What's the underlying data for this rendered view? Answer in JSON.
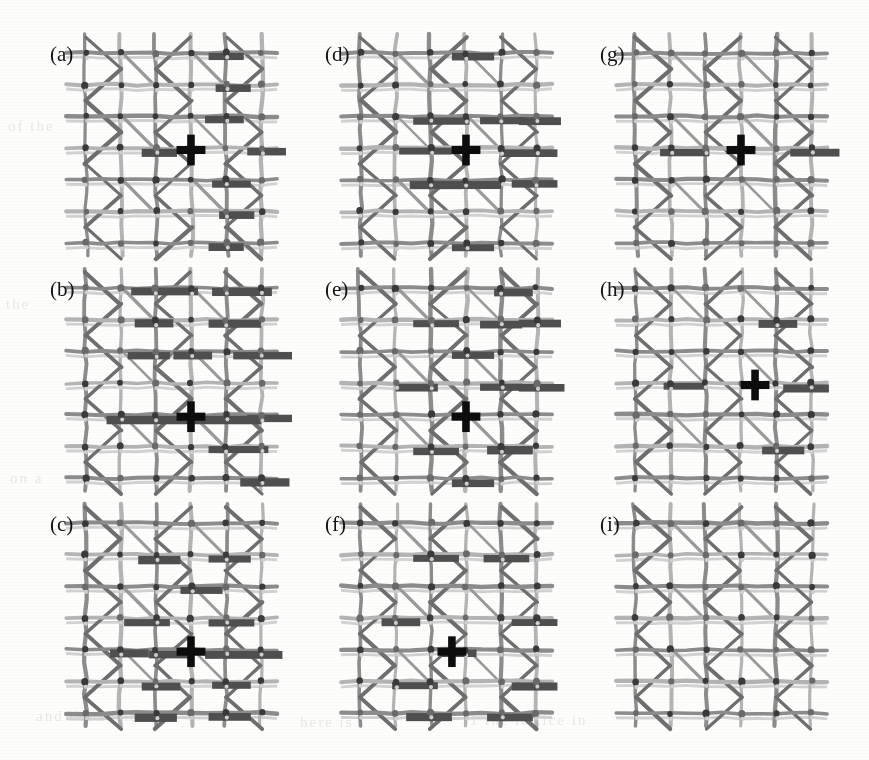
{
  "figure": {
    "title_visible": false,
    "kind": "multi-panel lattice network figure",
    "background_color": "#fdfdfc",
    "panel_rows": 3,
    "panel_cols": 3,
    "label_color": "#121212",
    "colors": {
      "grid_light": "#b4b4b4",
      "grid_mid": "#8c8c8c",
      "diagonal": "#6e6e6e",
      "bar_dark": "#4f4f4f",
      "node": "#3a3a3a",
      "marker": "#0d0d0d",
      "background": "#fdfdfc"
    },
    "legend_visible": false,
    "axes_visible": false
  },
  "chart_data": {
    "type": "diagram-grid",
    "title": "",
    "xlabel": "",
    "ylabel": "",
    "lattice": {
      "cols": 6,
      "rows": 7,
      "col_spacing": 39,
      "row_spacing": 33,
      "node_radius": 3.1
    },
    "panels": [
      {
        "id": "a",
        "label": "(a)",
        "row": 0,
        "col": 0,
        "marker": {
          "visible": true,
          "gx": 3,
          "gy": 3
        },
        "bars": [
          {
            "gx": 3.5,
            "gy": 0,
            "len": 1.0
          },
          {
            "gx": 3.7,
            "gy": 1,
            "len": 1.0
          },
          {
            "gx": 3.4,
            "gy": 2,
            "len": 1.1
          },
          {
            "gx": 1.6,
            "gy": 3,
            "len": 1.0
          },
          {
            "gx": 4.6,
            "gy": 3,
            "len": 1.1
          },
          {
            "gx": 3.6,
            "gy": 4,
            "len": 1.1
          },
          {
            "gx": 3.8,
            "gy": 5,
            "len": 1.0
          },
          {
            "gx": 3.5,
            "gy": 6,
            "len": 1.0
          }
        ]
      },
      {
        "id": "b",
        "label": "(b)",
        "row": 1,
        "col": 0,
        "marker": {
          "visible": true,
          "gx": 3,
          "gy": 4
        },
        "bars": [
          {
            "gx": 1.3,
            "gy": 0,
            "len": 1.9
          },
          {
            "gx": 3.6,
            "gy": 0,
            "len": 1.7
          },
          {
            "gx": 1.4,
            "gy": 1,
            "len": 1.1
          },
          {
            "gx": 3.5,
            "gy": 1,
            "len": 1.5
          },
          {
            "gx": 1.2,
            "gy": 2,
            "len": 1.2
          },
          {
            "gx": 2.5,
            "gy": 2,
            "len": 1.1
          },
          {
            "gx": 4.2,
            "gy": 2,
            "len": 1.8
          },
          {
            "gx": 0.6,
            "gy": 4,
            "len": 4.4
          },
          {
            "gx": 4.6,
            "gy": 4,
            "len": 1.6
          },
          {
            "gx": 3.5,
            "gy": 5,
            "len": 1.7
          },
          {
            "gx": 4.4,
            "gy": 6,
            "len": 1.4
          }
        ]
      },
      {
        "id": "c",
        "label": "(c)",
        "row": 2,
        "col": 0,
        "marker": {
          "visible": true,
          "gx": 3,
          "gy": 4
        },
        "bars": [
          {
            "gx": 1.5,
            "gy": 1,
            "len": 1.2
          },
          {
            "gx": 3.5,
            "gy": 1,
            "len": 1.2
          },
          {
            "gx": 2.7,
            "gy": 2,
            "len": 1.2
          },
          {
            "gx": 1.1,
            "gy": 3,
            "len": 1.3
          },
          {
            "gx": 3.5,
            "gy": 3,
            "len": 1.3
          },
          {
            "gx": 0.7,
            "gy": 4,
            "len": 1.1
          },
          {
            "gx": 1.8,
            "gy": 4,
            "len": 1.2
          },
          {
            "gx": 3.4,
            "gy": 4,
            "len": 2.2
          },
          {
            "gx": 1.6,
            "gy": 5,
            "len": 1.1
          },
          {
            "gx": 3.6,
            "gy": 5,
            "len": 1.1
          },
          {
            "gx": 1.4,
            "gy": 6,
            "len": 1.2
          },
          {
            "gx": 3.5,
            "gy": 6,
            "len": 1.2
          }
        ]
      },
      {
        "id": "d",
        "label": "(d)",
        "row": 0,
        "col": 1,
        "marker": {
          "visible": true,
          "gx": 3,
          "gy": 3
        },
        "bars": [
          {
            "gx": 2.6,
            "gy": 0,
            "len": 1.2
          },
          {
            "gx": 1.5,
            "gy": 2,
            "len": 1.6
          },
          {
            "gx": 3.4,
            "gy": 2,
            "len": 1.3
          },
          {
            "gx": 4.5,
            "gy": 2,
            "len": 1.2
          },
          {
            "gx": 1.1,
            "gy": 3,
            "len": 1.5
          },
          {
            "gx": 4.0,
            "gy": 3,
            "len": 1.6
          },
          {
            "gx": 1.4,
            "gy": 4,
            "len": 1.5
          },
          {
            "gx": 2.8,
            "gy": 4,
            "len": 1.2
          },
          {
            "gx": 4.3,
            "gy": 4,
            "len": 1.3
          },
          {
            "gx": 2.6,
            "gy": 6,
            "len": 1.2
          }
        ]
      },
      {
        "id": "e",
        "label": "(e)",
        "row": 1,
        "col": 1,
        "marker": {
          "visible": true,
          "gx": 3,
          "gy": 4
        },
        "bars": [
          {
            "gx": 3.8,
            "gy": 0,
            "len": 1.1
          },
          {
            "gx": 1.5,
            "gy": 1,
            "len": 1.3
          },
          {
            "gx": 3.4,
            "gy": 1,
            "len": 1.2
          },
          {
            "gx": 4.5,
            "gy": 1,
            "len": 1.2
          },
          {
            "gx": 2.6,
            "gy": 2,
            "len": 1.2
          },
          {
            "gx": 1.0,
            "gy": 3,
            "len": 1.2
          },
          {
            "gx": 3.4,
            "gy": 3,
            "len": 1.2
          },
          {
            "gx": 4.5,
            "gy": 3,
            "len": 1.3
          },
          {
            "gx": 1.5,
            "gy": 5,
            "len": 1.3
          },
          {
            "gx": 3.6,
            "gy": 5,
            "len": 1.3
          },
          {
            "gx": 2.6,
            "gy": 6,
            "len": 1.2
          }
        ]
      },
      {
        "id": "f",
        "label": "(f)",
        "row": 2,
        "col": 1,
        "marker": {
          "visible": true,
          "gx": 2.6,
          "gy": 4
        },
        "bars": [
          {
            "gx": 1.5,
            "gy": 1,
            "len": 1.3
          },
          {
            "gx": 3.5,
            "gy": 1,
            "len": 1.3
          },
          {
            "gx": 0.6,
            "gy": 3,
            "len": 1.1
          },
          {
            "gx": 4.3,
            "gy": 3,
            "len": 1.3
          },
          {
            "gx": 2.3,
            "gy": 4,
            "len": 1.0
          },
          {
            "gx": 0.9,
            "gy": 5,
            "len": 1.3
          },
          {
            "gx": 4.3,
            "gy": 5,
            "len": 1.3
          },
          {
            "gx": 1.3,
            "gy": 6,
            "len": 1.3
          },
          {
            "gx": 3.6,
            "gy": 6,
            "len": 1.3
          }
        ]
      },
      {
        "id": "g",
        "label": "(g)",
        "row": 0,
        "col": 2,
        "marker": {
          "visible": true,
          "gx": 3,
          "gy": 3
        },
        "bars": [
          {
            "gx": 0.7,
            "gy": 3,
            "len": 1.4
          },
          {
            "gx": 4.4,
            "gy": 3,
            "len": 1.4
          }
        ]
      },
      {
        "id": "h",
        "label": "(h)",
        "row": 1,
        "col": 2,
        "marker": {
          "visible": true,
          "gx": 3.4,
          "gy": 3
        },
        "bars": [
          {
            "gx": 3.5,
            "gy": 1,
            "len": 1.1
          },
          {
            "gx": 0.8,
            "gy": 3,
            "len": 1.2
          },
          {
            "gx": 4.2,
            "gy": 3,
            "len": 1.3
          },
          {
            "gx": 3.6,
            "gy": 5,
            "len": 1.2
          }
        ]
      },
      {
        "id": "i",
        "label": "(i)",
        "row": 2,
        "col": 2,
        "marker": {
          "visible": false,
          "gx": 3,
          "gy": 3
        },
        "bars": []
      }
    ]
  },
  "ghost_text": [
    {
      "text": "of the",
      "x": 8,
      "y": 118
    },
    {
      "text": "the",
      "x": 6,
      "y": 296
    },
    {
      "text": "on a",
      "x": 10,
      "y": 470
    },
    {
      "text": "and the same",
      "x": 36,
      "y": 708
    },
    {
      "text": "here is",
      "x": 300,
      "y": 714
    },
    {
      "text": "1 the  lattice  in",
      "x": 470,
      "y": 712
    },
    {
      "text": "in  the",
      "x": 748,
      "y": 706
    }
  ]
}
